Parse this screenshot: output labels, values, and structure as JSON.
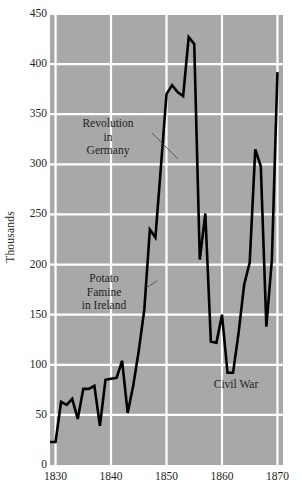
{
  "chart_data": {
    "type": "line",
    "title": "",
    "xlabel": "",
    "ylabel": "Thousands",
    "xlim": [
      1829,
      1871
    ],
    "ylim": [
      0,
      450
    ],
    "grid": true,
    "legend": false,
    "legend_position": "none",
    "x_ticks": [
      "1830",
      "1840",
      "1850",
      "1860",
      "1870"
    ],
    "x_tick_values": [
      1830,
      1840,
      1850,
      1860,
      1870
    ],
    "y_ticks": [
      "0",
      "50",
      "100",
      "150",
      "200",
      "250",
      "300",
      "350",
      "400",
      "450"
    ],
    "y_tick_values": [
      0,
      50,
      100,
      150,
      200,
      250,
      300,
      350,
      400,
      450
    ],
    "series": [
      {
        "name": "Immigration to the United States",
        "color": "#000000",
        "x": [
          1829,
          1830,
          1831,
          1832,
          1833,
          1834,
          1835,
          1836,
          1837,
          1838,
          1839,
          1840,
          1841,
          1842,
          1843,
          1844,
          1845,
          1846,
          1847,
          1848,
          1849,
          1850,
          1851,
          1852,
          1853,
          1854,
          1855,
          1856,
          1857,
          1858,
          1859,
          1860,
          1861,
          1862,
          1863,
          1864,
          1865,
          1866,
          1867,
          1868,
          1869,
          1870
        ],
        "y": [
          23,
          23,
          63,
          60,
          66,
          46,
          76,
          76,
          79,
          39,
          85,
          86,
          87,
          104,
          52,
          79,
          114,
          155,
          235,
          227,
          298,
          370,
          379,
          372,
          368,
          427,
          420,
          205,
          251,
          123,
          122,
          150,
          92,
          92,
          132,
          180,
          202,
          315,
          298,
          138,
          205,
          392
        ]
      }
    ],
    "annotations": [
      {
        "id": "revolution",
        "text_lines": [
          "Revolution",
          "in",
          "Germany"
        ],
        "leader_line": true
      },
      {
        "id": "famine",
        "text_lines": [
          "Potato",
          "Famine",
          "in Ireland"
        ],
        "leader_line": true
      },
      {
        "id": "civilwar",
        "text_lines": [
          "Civil War"
        ],
        "leader_line": false
      }
    ],
    "style": {
      "plot_background": "#a8a8a8",
      "grid_color": "#ffffff",
      "line_color": "#000000",
      "text_color": "#231f20",
      "page_background": "#ffffff"
    }
  }
}
